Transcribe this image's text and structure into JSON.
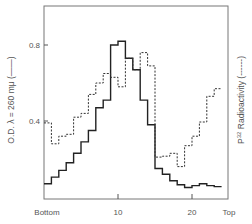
{
  "chart_data": {
    "type": "line",
    "step": true,
    "title": "",
    "xlabel": "",
    "ylabel": "O.D. λ = 260 mμ (——)",
    "ylabel_right": "P32 Radioactivity (------)",
    "x_tick_labels": [
      "Bottom",
      "10",
      "20",
      "Top"
    ],
    "y_ticks": [
      0.4,
      0.8
    ],
    "y_tick_labels": [
      "0.4",
      "0.8"
    ],
    "ylim": [
      0,
      1.0
    ],
    "grid": false,
    "x": [
      1,
      2,
      3,
      4,
      5,
      6,
      7,
      8,
      9,
      10,
      11,
      12,
      13,
      14,
      15,
      16,
      17,
      18,
      19,
      20,
      21,
      22,
      23,
      24
    ],
    "series": [
      {
        "name": "O.D. λ = 260 mμ",
        "style": "solid",
        "values": [
          0.07,
          0.105,
          0.14,
          0.18,
          0.23,
          0.29,
          0.35,
          0.47,
          0.51,
          0.8,
          0.82,
          0.73,
          0.67,
          0.51,
          0.38,
          0.15,
          0.12,
          0.085,
          0.065,
          0.05,
          0.06,
          0.07,
          0.06,
          0.055
        ]
      },
      {
        "name": "P32 Radioactivity",
        "style": "dashed",
        "values": [
          0.39,
          0.28,
          0.32,
          0.33,
          0.42,
          0.44,
          0.54,
          0.6,
          0.65,
          0.63,
          0.58,
          0.73,
          0.67,
          0.76,
          0.69,
          0.21,
          0.215,
          0.23,
          0.16,
          0.27,
          0.32,
          0.395,
          0.53,
          0.57
        ]
      }
    ]
  },
  "labels": {
    "y_left": "O.D. λ = 260 mμ (——)",
    "y_right_prefix": "P",
    "y_right_sup": "32",
    "y_right_rest": " Radioactivity (------)",
    "tick_08": "0.8",
    "tick_04": "0.4",
    "x_bottom": "Bottom",
    "x_10": "10",
    "x_20": "20",
    "x_top": "Top"
  }
}
